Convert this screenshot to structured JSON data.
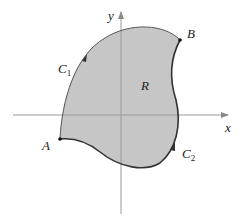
{
  "diagram": {
    "type": "region-with-boundary-curves",
    "axes": {
      "x_label": "x",
      "y_label": "y"
    },
    "points": [
      {
        "id": "A",
        "label": "A"
      },
      {
        "id": "B",
        "label": "B"
      }
    ],
    "curves": [
      {
        "id": "C1",
        "label": "C",
        "subscript": "1",
        "from": "A",
        "to": "B",
        "path": "upper-left boundary"
      },
      {
        "id": "C2",
        "label": "C",
        "subscript": "2",
        "from": "A",
        "to": "B",
        "path": "lower-right boundary"
      }
    ],
    "region": {
      "label": "R"
    },
    "colors": {
      "region_fill": "#c6c6c6",
      "curve_stroke": "#333333",
      "axis_stroke": "#9a9a9a"
    }
  }
}
